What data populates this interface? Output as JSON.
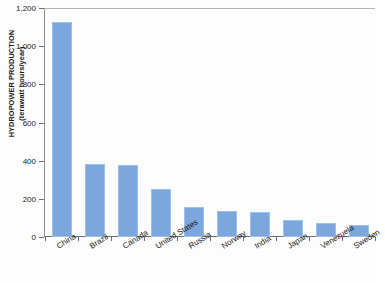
{
  "chart_data": {
    "type": "bar",
    "title": "",
    "xlabel": "",
    "ylabel": "HYDROPOWER PRODUCTION (terawatt hours/year)",
    "ylabel_line1": "HYDROPOWER PRODUCTION",
    "ylabel_line2": "(terawatt hours/year)",
    "categories": [
      "China",
      "Brazil",
      "Canada",
      "United States",
      "Russia",
      "Norway",
      "India",
      "Japan",
      "Venezuela",
      "Sweden"
    ],
    "values": [
      1125,
      385,
      375,
      250,
      157,
      136,
      131,
      89,
      73,
      63
    ],
    "ylim": [
      0,
      1200
    ],
    "ytick_values": [
      0,
      200,
      400,
      600,
      800,
      1000,
      1200
    ],
    "ytick_labels": [
      "0",
      "200",
      "400",
      "600",
      "800",
      "1,000",
      "1,200"
    ],
    "grid": false,
    "legend": null,
    "bar_color": "#7ba7dc",
    "bar_border_color": "#9dbfe8",
    "axis_color": "#6e6e6e",
    "text_color": "#1a1a1a"
  }
}
